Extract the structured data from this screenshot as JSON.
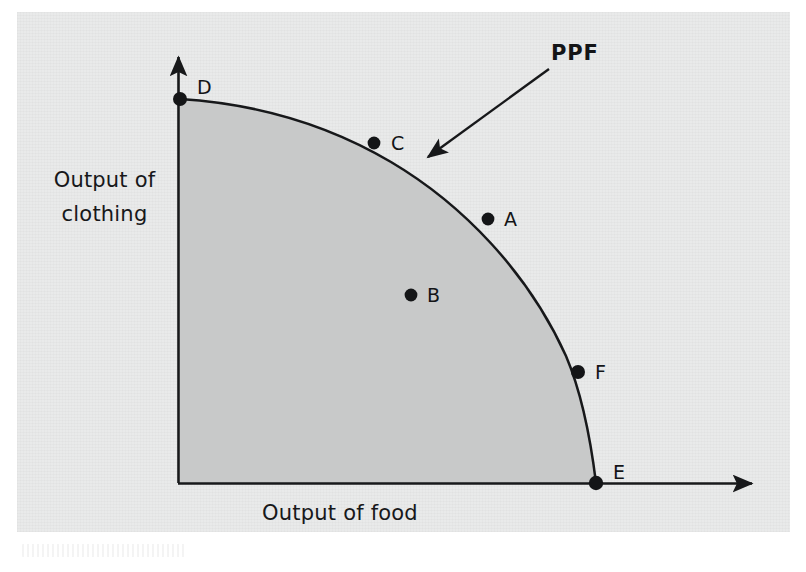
{
  "figure": {
    "kind": "production-possibility-frontier-diagram",
    "background_color": "#ffffff",
    "panel_color": "#e9eaea",
    "shaded_region_color": "#c8c9c9",
    "ink_color": "#17181a"
  },
  "axes": {
    "y_label_line1": "Output of",
    "y_label_line2": "clothing",
    "x_label": "Output of food",
    "x_axis_has_arrow": true,
    "y_axis_has_arrow": true
  },
  "annotation": {
    "ppf_label": "PPF",
    "arrow_from": [
      548,
      70
    ],
    "arrow_to": [
      423,
      161
    ]
  },
  "points": [
    {
      "id": "D",
      "label": "D",
      "x": 180,
      "y": 99,
      "label_x": 197,
      "label_y": 76,
      "on_frontier": true,
      "position": "y-intercept"
    },
    {
      "id": "C",
      "label": "C",
      "x": 374,
      "y": 143,
      "label_x": 391,
      "label_y": 132,
      "on_frontier": true,
      "position": "on-curve"
    },
    {
      "id": "A",
      "label": "A",
      "x": 488,
      "y": 219,
      "label_x": 504,
      "label_y": 208,
      "on_frontier": true,
      "position": "on-curve"
    },
    {
      "id": "B",
      "label": "B",
      "x": 411,
      "y": 295,
      "label_x": 427,
      "label_y": 284,
      "on_frontier": false,
      "position": "interior"
    },
    {
      "id": "F",
      "label": "F",
      "x": 578,
      "y": 372,
      "label_x": 595,
      "label_y": 361,
      "on_frontier": true,
      "position": "on-curve"
    },
    {
      "id": "E",
      "label": "E",
      "x": 596,
      "y": 483,
      "label_x": 613,
      "label_y": 461,
      "on_frontier": true,
      "position": "x-intercept"
    }
  ],
  "chart_data": {
    "type": "line",
    "title": "",
    "subtitle": "",
    "xlabel": "Output of food",
    "ylabel": "Output of clothing",
    "grid": false,
    "legend": false,
    "annotations": [
      "PPF"
    ],
    "axis_tick_labels": {
      "x": [],
      "y": []
    },
    "xlim": [
      0,
      1
    ],
    "ylim": [
      0,
      1
    ],
    "series": [
      {
        "name": "PPF",
        "description": "Production possibility frontier, concave to the origin, running from the vertical-axis intercept D down to the horizontal-axis intercept E",
        "shaded_below": true,
        "x": [
          0.0,
          0.1,
          0.2,
          0.3,
          0.4,
          0.47,
          0.55,
          0.62,
          0.7,
          0.78,
          0.86,
          0.93,
          0.98,
          1.0
        ],
        "y": [
          1.0,
          0.99,
          0.97,
          0.94,
          0.9,
          0.885,
          0.84,
          0.78,
          0.7,
          0.6,
          0.46,
          0.3,
          0.14,
          0.0
        ]
      }
    ],
    "labeled_points": [
      {
        "label": "D",
        "x": 0.0,
        "y": 1.0,
        "on_frontier": true
      },
      {
        "label": "C",
        "x": 0.47,
        "y": 0.885,
        "on_frontier": true
      },
      {
        "label": "A",
        "x": 0.74,
        "y": 0.686,
        "on_frontier": true
      },
      {
        "label": "B",
        "x": 0.56,
        "y": 0.49,
        "on_frontier": false
      },
      {
        "label": "F",
        "x": 0.96,
        "y": 0.289,
        "on_frontier": true
      },
      {
        "label": "E",
        "x": 1.0,
        "y": 0.0,
        "on_frontier": true
      }
    ]
  }
}
